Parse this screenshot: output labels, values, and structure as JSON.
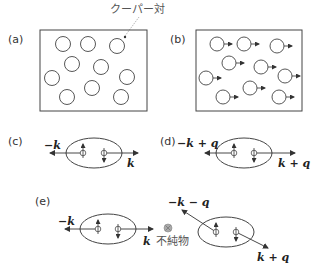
{
  "panels": {
    "a": {
      "label": "(a)",
      "annotation": "クーパー対"
    },
    "b": {
      "label": "(b)"
    },
    "c": {
      "label": "(c)",
      "left_momentum": "−k",
      "right_momentum": "k"
    },
    "d": {
      "label": "(d)",
      "left_momentum": "−k + q",
      "right_momentum": "k + q"
    },
    "e": {
      "label": "(e)",
      "left_pair": {
        "left_momentum": "−k",
        "right_momentum": "k"
      },
      "impurity_label": "不純物",
      "right_pair": {
        "left_momentum": "−k − q",
        "right_momentum": "k + q"
      }
    }
  },
  "colors": {
    "stroke": "#333333",
    "impurity": "#999999",
    "text": "#333333"
  }
}
